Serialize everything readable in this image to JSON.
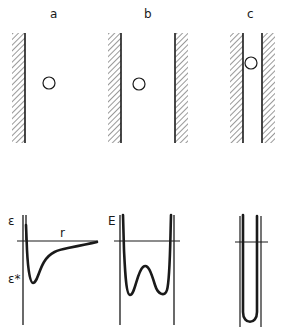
{
  "figure": {
    "panels": [
      {
        "id": "a",
        "label": "a",
        "description": "Particle far from walls in wide channel",
        "energy_label": "ε",
        "distance_label": "r",
        "minimum_label": "ε*",
        "curve": "single-well potential near one wall"
      },
      {
        "id": "b",
        "label": "b",
        "energy_label": "E",
        "description": "Particle in narrower channel",
        "curve": "double-well potential between two walls"
      },
      {
        "id": "c",
        "label": "c",
        "description": "Particle in very narrow channel",
        "curve": "single narrow well"
      }
    ],
    "colors": {
      "ink": "#1a1a1a",
      "background": "#ffffff"
    }
  }
}
